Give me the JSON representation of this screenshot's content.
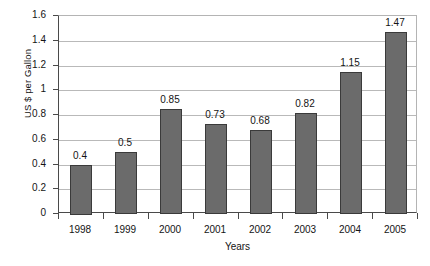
{
  "chart_data": {
    "type": "bar",
    "title": "",
    "categories": [
      "1998",
      "1999",
      "2000",
      "2001",
      "2002",
      "2003",
      "2004",
      "2005"
    ],
    "values": [
      0.4,
      0.5,
      0.85,
      0.73,
      0.68,
      0.82,
      1.15,
      1.47
    ],
    "data_labels": [
      "0.4",
      "0.5",
      "0.85",
      "0.73",
      "0.68",
      "0.82",
      "1.15",
      "1.47"
    ],
    "xlabel": "Years",
    "ylabel": "US $ per Gallon",
    "ylim": [
      0,
      1.6
    ],
    "ytick_step": 0.2,
    "ytick_labels": [
      "0",
      "0.2",
      "0.4",
      "0.6",
      "0.8",
      "1",
      "1.2",
      "1.4",
      "1.6"
    ],
    "ytick_values": [
      0,
      0.2,
      0.4,
      0.6,
      0.8,
      1,
      1.2,
      1.4,
      1.6
    ],
    "grid": true,
    "grid_axis": "y",
    "legend": false,
    "legend_position": "none",
    "bar_color": "#6b6b6b",
    "bar_border_color": "#3a3a3a",
    "gridline_color": "#b9b9b9",
    "axis_color": "#4a4a4a",
    "background_color": "#ffffff"
  }
}
